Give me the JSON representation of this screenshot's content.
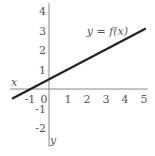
{
  "chart_data": {
    "type": "line",
    "title": "",
    "xlabel": "x",
    "ylabel": "y",
    "xlim": [
      -2,
      5.2
    ],
    "ylim": [
      -2.8,
      4.4
    ],
    "grid": false,
    "x_ticks": [
      -1,
      0,
      1,
      2,
      3,
      4,
      5
    ],
    "y_ticks": [
      -2,
      -1,
      1,
      2,
      3,
      4
    ],
    "x_tick_labels": [
      "-1",
      "0",
      "1",
      "2",
      "3",
      "4",
      "5"
    ],
    "y_tick_labels": [
      "-2",
      "-1",
      "1",
      "2",
      "3",
      "4"
    ],
    "series": [
      {
        "name": "y = f(x)",
        "x": [
          -2,
          5.2
        ],
        "y": [
          -0.5,
          3.1
        ],
        "color": "#222222"
      }
    ],
    "annotations": [
      {
        "text": "y = f(x)",
        "x": 2.2,
        "y": 3.0
      }
    ]
  },
  "labels": {
    "x_axis": "x",
    "y_axis": "y",
    "curve": "y = f(x)"
  },
  "colors": {
    "axis": "#888888",
    "curve": "#222222",
    "text": "#555555"
  }
}
